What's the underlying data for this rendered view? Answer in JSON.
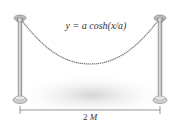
{
  "figure": {
    "formula": "y = a cosh(x/a)",
    "dimension": {
      "number": "2",
      "variable": "M"
    },
    "elements": [
      "left-post",
      "right-post",
      "chain-catenary",
      "ground-shadow",
      "dimension-line"
    ],
    "colors": {
      "post": "#b8b8b8",
      "post_dark": "#8a8a8a",
      "chain": "#7a7a7a",
      "shadow": "#dcdcdc",
      "text": "#333333"
    }
  }
}
